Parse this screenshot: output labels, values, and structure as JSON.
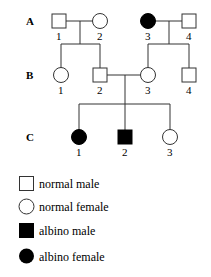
{
  "diagram": {
    "type": "pedigree",
    "generations": [
      {
        "label": "A",
        "members": [
          {
            "num": "1",
            "sex": "male",
            "affected": false
          },
          {
            "num": "2",
            "sex": "female",
            "affected": false
          },
          {
            "num": "3",
            "sex": "female",
            "affected": true
          },
          {
            "num": "4",
            "sex": "male",
            "affected": false
          }
        ]
      },
      {
        "label": "B",
        "members": [
          {
            "num": "1",
            "sex": "female",
            "affected": false
          },
          {
            "num": "2",
            "sex": "male",
            "affected": false
          },
          {
            "num": "3",
            "sex": "female",
            "affected": false
          },
          {
            "num": "4",
            "sex": "male",
            "affected": false
          }
        ]
      },
      {
        "label": "C",
        "members": [
          {
            "num": "1",
            "sex": "female",
            "affected": true
          },
          {
            "num": "2",
            "sex": "male",
            "affected": true
          },
          {
            "num": "3",
            "sex": "female",
            "affected": false
          }
        ]
      }
    ],
    "relationships": [
      {
        "couple": [
          "A1",
          "A2"
        ],
        "children": [
          "B1",
          "B2"
        ]
      },
      {
        "couple": [
          "A3",
          "A4"
        ],
        "children": [
          "B3",
          "B4"
        ]
      },
      {
        "couple": [
          "B2",
          "B3"
        ],
        "children": [
          "C1",
          "C2",
          "C3"
        ]
      }
    ]
  },
  "legend": {
    "items": [
      {
        "symbol": "open-square",
        "label": "normal male"
      },
      {
        "symbol": "open-circle",
        "label": "normal female"
      },
      {
        "symbol": "filled-square",
        "label": "albino male"
      },
      {
        "symbol": "filled-circle",
        "label": "albino female"
      }
    ]
  },
  "colors": {
    "line": "#333333",
    "affected_fill": "#000000",
    "unaffected_fill": "#ffffff"
  }
}
